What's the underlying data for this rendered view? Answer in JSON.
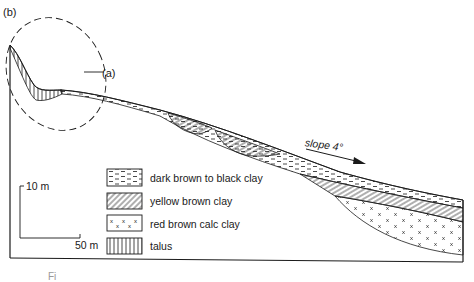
{
  "figure": {
    "panel_label": "(b)",
    "inset_reference_label": "(a)",
    "slope_label": "slope 4°",
    "caption_fragment": "Fi"
  },
  "scale_bar": {
    "vertical_label": "10 m",
    "horizontal_label": "50 m"
  },
  "legend": {
    "items": [
      {
        "pattern": "dashes",
        "label": "dark brown to black clay"
      },
      {
        "pattern": "diagonal-hatch",
        "label": "yellow brown clay"
      },
      {
        "pattern": "x-marks",
        "label": "red brown calc clay"
      },
      {
        "pattern": "vertical-lines",
        "label": "talus"
      }
    ]
  },
  "colors": {
    "ink": "#1a1a1a",
    "background": "#ffffff"
  }
}
